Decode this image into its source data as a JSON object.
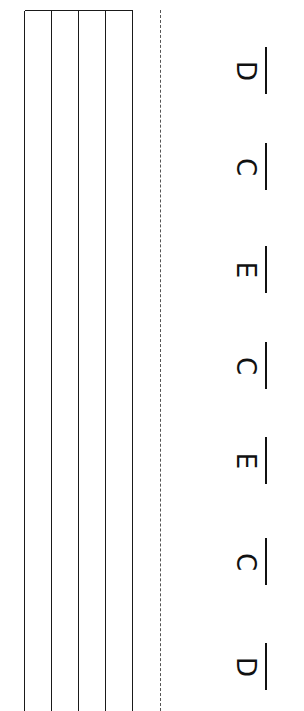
{
  "worksheet": {
    "orientation": "rotated-90",
    "grid": {
      "strings": 5,
      "string_x": [
        25,
        52,
        79,
        106,
        133
      ],
      "top_y": 10,
      "line_color": "#1a1a1a"
    },
    "cut_line": {
      "x": 160,
      "style": "dashed",
      "color": "#555555"
    },
    "answers": [
      {
        "letter": "D",
        "y": 47
      },
      {
        "letter": "C",
        "y": 143
      },
      {
        "letter": "E",
        "y": 246
      },
      {
        "letter": "C",
        "y": 342
      },
      {
        "letter": "E",
        "y": 437
      },
      {
        "letter": "C",
        "y": 538
      },
      {
        "letter": "D",
        "y": 643
      }
    ]
  }
}
